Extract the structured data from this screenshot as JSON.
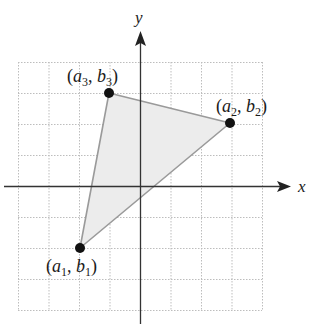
{
  "diagram": {
    "type": "coordinate-plane-triangle",
    "axes": {
      "x_label": "x",
      "y_label": "y"
    },
    "grid": {
      "x_range": [
        -4,
        4
      ],
      "y_range": [
        -4,
        4
      ],
      "step": 1,
      "style": "dotted"
    },
    "colors": {
      "grid": "#bdbdbd",
      "axis": "#333333",
      "triangle_fill": "#ececec",
      "triangle_edge": "#9a9a9a",
      "point": "#111111"
    },
    "points": [
      {
        "id": "p1",
        "label_var": "a",
        "label_var2": "b",
        "index": "1",
        "x": -2,
        "y": -2,
        "open": "(",
        "comma": ", ",
        "close": ")"
      },
      {
        "id": "p2",
        "label_var": "a",
        "label_var2": "b",
        "index": "2",
        "x": 3,
        "y": 2,
        "open": "(",
        "comma": ", ",
        "close": ")"
      },
      {
        "id": "p3",
        "label_var": "a",
        "label_var2": "b",
        "index": "3",
        "x": -1,
        "y": 3,
        "open": "(",
        "comma": ", ",
        "close": ")"
      }
    ]
  }
}
